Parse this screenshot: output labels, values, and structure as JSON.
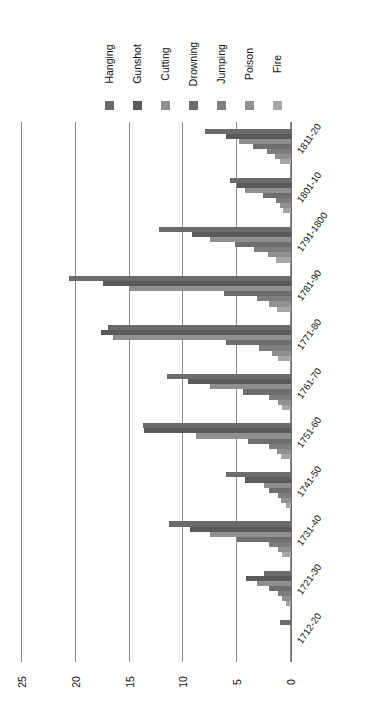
{
  "chart_data": {
    "type": "bar",
    "orientation": "horizontal-rotated",
    "title": "",
    "xlabel": "",
    "ylabel": "",
    "ylim": [
      0,
      25
    ],
    "yticks": [
      0,
      5,
      10,
      15,
      20,
      25
    ],
    "grid": true,
    "legend_position": "top",
    "categories": [
      "1712-20",
      "1721-30",
      "1731-40",
      "1741-50",
      "1751-60",
      "1761-70",
      "1771-80",
      "1781-90",
      "1791-1800",
      "1801-10",
      "1811-20"
    ],
    "series": [
      {
        "name": "Hanging",
        "color": "#6b6b6b",
        "values": [
          1.0,
          2.5,
          11.3,
          6.0,
          13.8,
          11.5,
          17.0,
          20.6,
          12.3,
          5.7,
          8.0
        ]
      },
      {
        "name": "Gunshot",
        "color": "#5a5a5a",
        "values": [
          0.0,
          4.2,
          9.4,
          4.3,
          13.7,
          9.6,
          17.7,
          17.5,
          9.2,
          5.0,
          6.0
        ]
      },
      {
        "name": "Cutting",
        "color": "#8f8f8f",
        "values": [
          0.0,
          3.2,
          7.5,
          2.5,
          8.8,
          7.5,
          16.5,
          15.0,
          7.5,
          4.3,
          4.8
        ]
      },
      {
        "name": "Drowning",
        "color": "#6e6e6e",
        "values": [
          0.0,
          2.0,
          5.0,
          2.0,
          4.0,
          4.5,
          6.0,
          6.2,
          5.2,
          2.6,
          3.5
        ]
      },
      {
        "name": "Jumping",
        "color": "#7d7d7d",
        "values": [
          0.0,
          1.2,
          2.0,
          1.2,
          2.0,
          2.0,
          3.0,
          3.2,
          3.4,
          1.4,
          2.2
        ]
      },
      {
        "name": "Poison",
        "color": "#909090",
        "values": [
          0.0,
          0.8,
          1.2,
          0.9,
          1.3,
          1.2,
          1.8,
          2.0,
          2.1,
          1.0,
          1.5
        ]
      },
      {
        "name": "Fire",
        "color": "#a6a6a6",
        "values": [
          0.0,
          0.5,
          0.8,
          0.5,
          0.9,
          0.8,
          1.2,
          1.3,
          1.4,
          0.7,
          1.0
        ]
      }
    ]
  },
  "legend": {
    "items": [
      {
        "label": "Hanging"
      },
      {
        "label": "Gunshot"
      },
      {
        "label": "Cutting"
      },
      {
        "label": "Drowning"
      },
      {
        "label": "Jumping"
      },
      {
        "label": "Poison"
      },
      {
        "label": "Fire"
      }
    ]
  }
}
